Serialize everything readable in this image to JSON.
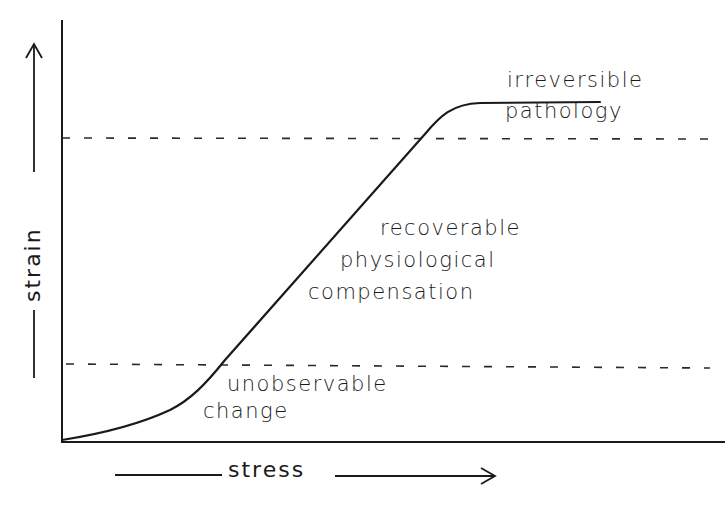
{
  "diagram": {
    "type": "stress-strain response curve",
    "axes": {
      "x_label": "stress",
      "y_label": "strain",
      "x_arrow": "right",
      "y_arrow": "up"
    },
    "thresholds": [
      {
        "name": "upper-threshold",
        "style": "dashed",
        "y_fraction": 0.72
      },
      {
        "name": "lower-threshold",
        "style": "dashed",
        "y_fraction": 0.19
      }
    ],
    "regions": {
      "top": {
        "line1": "irreversible",
        "line2": "pathology"
      },
      "middle": {
        "line1": "recoverable",
        "line2": "physiological",
        "line3": "compensation"
      },
      "bottom": {
        "line1": "unobservable",
        "line2": "change"
      }
    },
    "curve": {
      "shape": "sigmoid",
      "description": "slow initial rise, linear middle section, plateau at top"
    },
    "colors": {
      "line": "#1a1a1a",
      "background": "#ffffff"
    }
  }
}
